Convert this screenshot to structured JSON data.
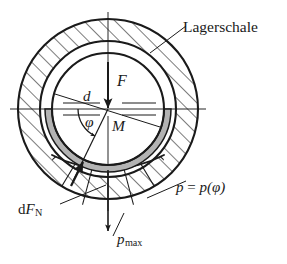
{
  "figure": {
    "background_color": "#ffffff",
    "line_color": "#1a1a1a",
    "gap_fill_color": "#b3b3b3",
    "hatch_color": "#1a1a1a",
    "width": 287,
    "height": 264
  },
  "labels": {
    "bearing_shell": "Lagerschale",
    "force": "F",
    "diameter": "d",
    "angle": "φ",
    "center": "M",
    "pressure_function_p": "p",
    "pressure_function_equals": "=",
    "pressure_function_arg": "p(φ)",
    "normal_force_d": "d",
    "normal_force_F": "F",
    "normal_force_sub": "N",
    "pressure_max_p": "p",
    "pressure_max_sub": "max"
  },
  "geometry": {
    "center_x": 108,
    "center_y": 109,
    "outer_shell_radius": 90,
    "shell_inner_radius": 68,
    "gap_outer_radius": 63,
    "shaft_radius": 56,
    "pressure_curve_max_radius": 120,
    "angle_arc_radius": 30,
    "angle_start_degrees": 180,
    "angle_end_degrees": 245
  },
  "elements": {
    "outer_circle": "bearing-shell-outer-circle",
    "middle_circle": "bearing-shell-inner-circle",
    "shaft_circle": "shaft-circle",
    "gap_band": "lubrication-gap-band",
    "hatching": "section-hatching",
    "centerline_horizontal": "horizontal-centerline",
    "centerline_vertical": "vertical-centerline",
    "force_arrow": "force-arrow",
    "diameter_line": "diameter-dimension-line",
    "angle_arc": "angle-arc",
    "radial_line": "radial-reference-line",
    "pressure_curve": "pressure-distribution-curve",
    "pressure_rays": "pressure-distribution-rays",
    "dfn_arrow": "normal-force-arrow",
    "pmax_arrow": "max-pressure-arrow",
    "leader_lagerschale": "leader-line-lagerschale",
    "leader_p_of_phi": "leader-line-p-of-phi",
    "leader_dfn": "leader-line-dfn",
    "leader_pmax": "leader-line-pmax"
  }
}
